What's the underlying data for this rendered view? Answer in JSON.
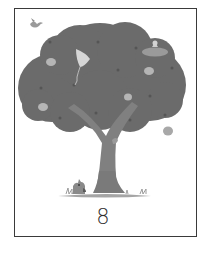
{
  "card": {
    "number_label": "8",
    "subject": "apple tree",
    "elements": [
      "bird",
      "kite",
      "cat-on-cloud",
      "apples",
      "squirrel",
      "dog",
      "grass"
    ]
  },
  "colors": {
    "frame": "#3a3a3a",
    "canopy": "#6b6b6b",
    "canopy_dark": "#5a5a5a",
    "trunk": "#808080",
    "apple": "#b5b5b5",
    "kite": "#d6d6d6",
    "grass": "#9a9a9a",
    "number": "#2e2e2e"
  }
}
